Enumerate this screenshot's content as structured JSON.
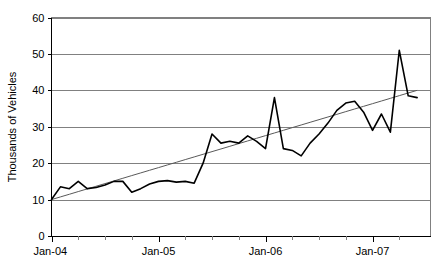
{
  "chart_data": {
    "type": "line",
    "title": "",
    "xlabel": "",
    "ylabel": "Thousands of Vehicles",
    "ylim": [
      0,
      60
    ],
    "ytick_values": [
      0,
      10,
      20,
      30,
      40,
      50,
      60
    ],
    "ytick_labels": [
      "0",
      "10",
      "20",
      "30",
      "40",
      "50",
      "60"
    ],
    "grid": true,
    "legend": "none",
    "xtick_labels": [
      "Jan-04",
      "Jan-05",
      "Jan-06",
      "Jan-07"
    ],
    "xtick_label_indices": [
      0,
      12,
      24,
      36
    ],
    "xlim_labels": [
      "Jan-04",
      "Jul-07"
    ],
    "minor_tick_interval_months": 3,
    "x": [
      "Jan-04",
      "Feb-04",
      "Mar-04",
      "Apr-04",
      "May-04",
      "Jun-04",
      "Jul-04",
      "Aug-04",
      "Sep-04",
      "Oct-04",
      "Nov-04",
      "Dec-04",
      "Jan-05",
      "Feb-05",
      "Mar-05",
      "Apr-05",
      "May-05",
      "Jun-05",
      "Jul-05",
      "Aug-05",
      "Sep-05",
      "Oct-05",
      "Nov-05",
      "Dec-05",
      "Jan-06",
      "Feb-06",
      "Mar-06",
      "Apr-06",
      "May-06",
      "Jun-06",
      "Jul-06",
      "Aug-06",
      "Sep-06",
      "Oct-06",
      "Nov-06",
      "Dec-06",
      "Jan-07",
      "Feb-07",
      "Mar-07",
      "Apr-07",
      "May-07",
      "Jun-07"
    ],
    "series": [
      {
        "name": "Vehicles",
        "style": "solid-black-line",
        "color": "#000000",
        "values": [
          10.0,
          13.5,
          13.0,
          15.0,
          13.0,
          13.3,
          14.0,
          15.0,
          15.0,
          12.0,
          13.0,
          14.3,
          15.0,
          15.2,
          14.8,
          15.0,
          14.5,
          20.0,
          28.0,
          25.5,
          26.0,
          25.5,
          27.5,
          26.0,
          24.0,
          38.0,
          24.0,
          23.5,
          22.0,
          25.5,
          28.0,
          31.0,
          34.5,
          36.5,
          37.0,
          34.0,
          29.0,
          33.5,
          28.5,
          51.0,
          38.5,
          38.0
        ]
      },
      {
        "name": "Linear trend",
        "style": "thin-gray-line",
        "color": "#595959",
        "start_value": 10.0,
        "end_value": 40.0,
        "values": [
          10.0,
          10.73,
          11.46,
          12.2,
          12.93,
          13.66,
          14.39,
          15.12,
          15.85,
          16.59,
          17.32,
          18.05,
          18.78,
          19.51,
          20.24,
          20.98,
          21.71,
          22.44,
          23.17,
          23.9,
          24.63,
          25.37,
          26.1,
          26.83,
          27.56,
          28.29,
          29.02,
          29.76,
          30.49,
          31.22,
          31.95,
          32.68,
          33.41,
          34.15,
          34.88,
          35.61,
          36.34,
          37.07,
          37.8,
          38.54,
          39.27,
          40.0
        ]
      }
    ]
  },
  "axis": {
    "y_title": "Thousands of Vehicles"
  }
}
